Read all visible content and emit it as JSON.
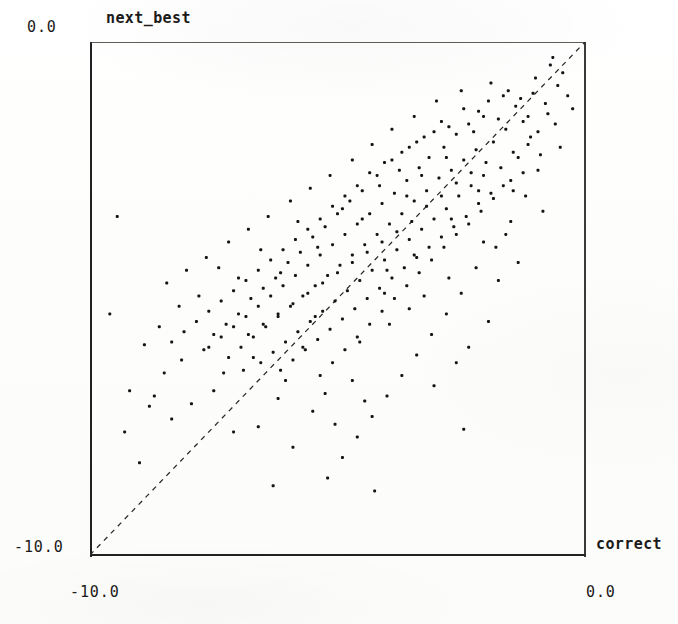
{
  "chart_data": {
    "type": "scatter",
    "title": "",
    "xlabel": "correct",
    "ylabel": "next_best",
    "xlim": [
      -10.0,
      0.0
    ],
    "ylim": [
      -10.0,
      0.0
    ],
    "grid": false,
    "legend": null,
    "xticks": [
      "-10.0",
      "0.0"
    ],
    "yticks": [
      "-10.0",
      "0.0"
    ],
    "annotations": [
      {
        "type": "line",
        "name": "identity-line",
        "style": "dashed",
        "from": [
          -10.0,
          -10.0
        ],
        "to": [
          0.0,
          0.0
        ]
      }
    ],
    "marker": {
      "shape": "square",
      "color": "#151313",
      "size": 3.0
    },
    "n_points": 282,
    "points": [
      [
        -1.05,
        -1.0
      ],
      [
        -0.55,
        -0.85
      ],
      [
        -1.4,
        -1.25
      ],
      [
        -0.75,
        -1.4
      ],
      [
        -1.95,
        -1.15
      ],
      [
        -1.25,
        -1.55
      ],
      [
        -2.05,
        -1.45
      ],
      [
        -0.95,
        -1.75
      ],
      [
        -1.6,
        -1.7
      ],
      [
        -2.35,
        -1.6
      ],
      [
        -1.15,
        -2.0
      ],
      [
        -2.6,
        -1.8
      ],
      [
        -1.85,
        -1.95
      ],
      [
        -3.05,
        -1.75
      ],
      [
        -2.2,
        -2.1
      ],
      [
        -1.35,
        -2.25
      ],
      [
        -2.85,
        -2.05
      ],
      [
        -3.4,
        -1.95
      ],
      [
        -2.45,
        -2.3
      ],
      [
        -1.7,
        -2.45
      ],
      [
        -3.15,
        -2.25
      ],
      [
        -2.05,
        -2.6
      ],
      [
        -3.7,
        -2.15
      ],
      [
        -2.7,
        -2.5
      ],
      [
        -1.5,
        -2.7
      ],
      [
        -3.35,
        -2.45
      ],
      [
        -2.3,
        -2.8
      ],
      [
        -4.05,
        -2.35
      ],
      [
        -2.95,
        -2.65
      ],
      [
        -1.9,
        -2.95
      ],
      [
        -3.6,
        -2.7
      ],
      [
        -2.55,
        -3.0
      ],
      [
        -4.35,
        -2.55
      ],
      [
        -3.2,
        -2.9
      ],
      [
        -2.15,
        -3.15
      ],
      [
        -3.85,
        -2.95
      ],
      [
        -2.8,
        -3.25
      ],
      [
        -4.6,
        -2.8
      ],
      [
        -3.45,
        -3.1
      ],
      [
        -2.4,
        -3.4
      ],
      [
        -4.1,
        -3.15
      ],
      [
        -3.05,
        -3.45
      ],
      [
        -4.85,
        -3.0
      ],
      [
        -3.7,
        -3.35
      ],
      [
        -2.65,
        -3.6
      ],
      [
        -4.35,
        -3.35
      ],
      [
        -3.3,
        -3.65
      ],
      [
        -5.1,
        -3.2
      ],
      [
        -3.95,
        -3.55
      ],
      [
        -2.9,
        -3.8
      ],
      [
        -4.6,
        -3.55
      ],
      [
        -3.55,
        -3.85
      ],
      [
        -5.35,
        -3.45
      ],
      [
        -4.2,
        -3.75
      ],
      [
        -3.15,
        -4.0
      ],
      [
        -4.85,
        -3.75
      ],
      [
        -3.8,
        -4.05
      ],
      [
        -5.6,
        -3.65
      ],
      [
        -4.45,
        -3.95
      ],
      [
        -3.4,
        -4.2
      ],
      [
        -5.1,
        -3.95
      ],
      [
        -4.05,
        -4.25
      ],
      [
        -5.85,
        -3.85
      ],
      [
        -4.7,
        -4.15
      ],
      [
        -3.65,
        -4.4
      ],
      [
        -5.35,
        -4.15
      ],
      [
        -4.3,
        -4.45
      ],
      [
        -6.1,
        -4.05
      ],
      [
        -4.95,
        -4.35
      ],
      [
        -3.9,
        -4.6
      ],
      [
        -5.6,
        -4.35
      ],
      [
        -4.55,
        -4.65
      ],
      [
        -6.35,
        -4.25
      ],
      [
        -5.2,
        -4.55
      ],
      [
        -4.15,
        -4.8
      ],
      [
        -5.85,
        -4.55
      ],
      [
        -4.8,
        -4.85
      ],
      [
        -6.6,
        -4.45
      ],
      [
        -5.45,
        -4.75
      ],
      [
        -4.4,
        -5.0
      ],
      [
        -6.1,
        -4.75
      ],
      [
        -5.05,
        -5.05
      ],
      [
        -6.85,
        -4.65
      ],
      [
        -5.7,
        -4.95
      ],
      [
        -4.65,
        -5.2
      ],
      [
        -6.35,
        -4.95
      ],
      [
        -5.3,
        -5.25
      ],
      [
        -7.1,
        -4.85
      ],
      [
        -5.95,
        -5.15
      ],
      [
        -4.9,
        -5.4
      ],
      [
        -6.6,
        -5.15
      ],
      [
        -5.55,
        -5.45
      ],
      [
        -7.35,
        -5.05
      ],
      [
        -6.2,
        -5.35
      ],
      [
        -5.15,
        -5.6
      ],
      [
        -6.85,
        -5.35
      ],
      [
        -5.8,
        -5.65
      ],
      [
        -7.6,
        -5.25
      ],
      [
        -6.45,
        -5.55
      ],
      [
        -5.4,
        -5.8
      ],
      [
        -7.1,
        -5.55
      ],
      [
        -6.05,
        -5.85
      ],
      [
        -7.85,
        -5.45
      ],
      [
        -6.7,
        -5.75
      ],
      [
        -5.65,
        -6.0
      ],
      [
        -7.35,
        -5.75
      ],
      [
        -6.3,
        -6.05
      ],
      [
        -8.1,
        -5.65
      ],
      [
        -6.95,
        -5.95
      ],
      [
        -5.9,
        -6.2
      ],
      [
        -7.6,
        -5.95
      ],
      [
        -6.55,
        -6.25
      ],
      [
        -8.35,
        -5.85
      ],
      [
        -7.2,
        -6.15
      ],
      [
        -6.15,
        -6.4
      ],
      [
        -0.8,
        -1.2
      ],
      [
        -1.55,
        -0.95
      ],
      [
        -2.15,
        -1.35
      ],
      [
        -0.6,
        -1.6
      ],
      [
        -1.75,
        -1.5
      ],
      [
        -2.45,
        -1.3
      ],
      [
        -1.1,
        -1.85
      ],
      [
        -2.75,
        -1.65
      ],
      [
        -1.45,
        -2.15
      ],
      [
        -3.25,
        -1.85
      ],
      [
        -2.0,
        -2.35
      ],
      [
        -1.25,
        -2.55
      ],
      [
        -3.55,
        -2.05
      ],
      [
        -2.3,
        -2.55
      ],
      [
        -1.65,
        -2.8
      ],
      [
        -3.9,
        -2.3
      ],
      [
        -2.6,
        -2.75
      ],
      [
        -1.85,
        -3.05
      ],
      [
        -4.2,
        -2.6
      ],
      [
        -2.9,
        -3.0
      ],
      [
        -2.1,
        -3.3
      ],
      [
        -4.5,
        -2.9
      ],
      [
        -3.2,
        -3.2
      ],
      [
        -2.35,
        -3.55
      ],
      [
        -4.75,
        -3.1
      ],
      [
        -3.5,
        -3.5
      ],
      [
        -2.6,
        -3.75
      ],
      [
        -5.0,
        -3.35
      ],
      [
        -3.8,
        -3.7
      ],
      [
        -2.85,
        -4.0
      ],
      [
        -5.25,
        -3.6
      ],
      [
        -4.1,
        -3.9
      ],
      [
        -3.1,
        -4.25
      ],
      [
        -5.5,
        -3.8
      ],
      [
        -4.4,
        -4.1
      ],
      [
        -3.35,
        -4.5
      ],
      [
        -5.75,
        -4.1
      ],
      [
        -4.7,
        -4.3
      ],
      [
        -3.6,
        -4.75
      ],
      [
        -6.0,
        -4.3
      ],
      [
        -5.0,
        -4.5
      ],
      [
        -3.85,
        -5.0
      ],
      [
        -6.25,
        -4.6
      ],
      [
        -5.3,
        -4.7
      ],
      [
        -4.1,
        -5.25
      ],
      [
        -6.5,
        -4.8
      ],
      [
        -5.6,
        -4.9
      ],
      [
        -4.35,
        -5.5
      ],
      [
        -6.75,
        -5.0
      ],
      [
        -5.9,
        -5.1
      ],
      [
        -4.6,
        -5.75
      ],
      [
        -7.0,
        -5.3
      ],
      [
        -6.2,
        -5.3
      ],
      [
        -4.85,
        -6.0
      ],
      [
        -7.25,
        -5.5
      ],
      [
        -6.5,
        -5.5
      ],
      [
        -5.1,
        -6.25
      ],
      [
        -7.5,
        -5.7
      ],
      [
        -6.8,
        -5.7
      ],
      [
        -5.35,
        -6.5
      ],
      [
        -0.45,
        -0.6
      ],
      [
        -0.35,
        -1.05
      ],
      [
        -1.9,
        -0.8
      ],
      [
        -0.9,
        -2.2
      ],
      [
        -2.5,
        -0.95
      ],
      [
        -1.2,
        -3.0
      ],
      [
        -3.0,
        -1.15
      ],
      [
        -1.5,
        -3.5
      ],
      [
        -3.45,
        -1.45
      ],
      [
        -1.8,
        -4.0
      ],
      [
        -3.9,
        -1.7
      ],
      [
        -2.2,
        -4.4
      ],
      [
        -4.3,
        -2.0
      ],
      [
        -2.5,
        -4.9
      ],
      [
        -4.7,
        -2.3
      ],
      [
        -2.8,
        -5.3
      ],
      [
        -5.15,
        -2.6
      ],
      [
        -3.1,
        -5.7
      ],
      [
        -5.55,
        -2.85
      ],
      [
        -3.4,
        -6.1
      ],
      [
        -5.95,
        -3.1
      ],
      [
        -3.7,
        -6.5
      ],
      [
        -6.4,
        -3.4
      ],
      [
        -4.0,
        -6.9
      ],
      [
        -6.8,
        -3.65
      ],
      [
        -4.3,
        -7.3
      ],
      [
        -7.2,
        -3.9
      ],
      [
        -4.6,
        -7.7
      ],
      [
        -7.65,
        -4.2
      ],
      [
        -4.9,
        -8.1
      ],
      [
        -8.05,
        -4.45
      ],
      [
        -5.2,
        -8.5
      ],
      [
        -8.45,
        -4.7
      ],
      [
        -0.25,
        -1.3
      ],
      [
        -0.7,
        -0.45
      ],
      [
        -1.0,
        -0.7
      ],
      [
        -1.3,
        -1.1
      ],
      [
        -1.65,
        -1.05
      ],
      [
        -2.25,
        -1.75
      ],
      [
        -2.9,
        -1.55
      ],
      [
        -3.3,
        -2.6
      ],
      [
        -3.6,
        -3.0
      ],
      [
        -4.15,
        -2.8
      ],
      [
        -4.5,
        -3.45
      ],
      [
        -4.9,
        -3.25
      ],
      [
        -5.4,
        -4.0
      ],
      [
        -5.8,
        -3.5
      ],
      [
        -6.15,
        -4.5
      ],
      [
        -6.55,
        -4.05
      ],
      [
        -7.0,
        -4.6
      ],
      [
        -7.4,
        -4.4
      ],
      [
        -7.8,
        -4.95
      ],
      [
        -8.2,
        -5.15
      ],
      [
        -8.6,
        -5.55
      ],
      [
        -6.9,
        -6.4
      ],
      [
        -7.5,
        -6.8
      ],
      [
        -6.2,
        -6.95
      ],
      [
        -5.5,
        -7.2
      ],
      [
        -6.6,
        -7.5
      ],
      [
        -5.9,
        -7.9
      ],
      [
        -7.1,
        -7.6
      ],
      [
        -4.7,
        -6.6
      ],
      [
        -5.05,
        -7.45
      ],
      [
        -4.45,
        -7.0
      ],
      [
        -8.15,
        -6.2
      ],
      [
        -7.7,
        -6.0
      ],
      [
        -8.5,
        -6.45
      ],
      [
        -8.9,
        -5.9
      ],
      [
        -9.2,
        -6.8
      ],
      [
        -3.95,
        -5.5
      ],
      [
        -3.25,
        -4.95
      ],
      [
        -2.75,
        -4.6
      ],
      [
        -2.05,
        -3.9
      ],
      [
        -1.45,
        -2.9
      ],
      [
        -9.45,
        -3.4
      ],
      [
        -6.3,
        -8.65
      ],
      [
        -4.25,
        -8.75
      ],
      [
        -8.8,
        -7.1
      ],
      [
        -9.0,
        -8.2
      ],
      [
        -2.6,
        -6.25
      ],
      [
        -3.05,
        -6.7
      ],
      [
        -2.35,
        -5.95
      ],
      [
        -1.95,
        -5.45
      ],
      [
        -8.35,
        -7.35
      ],
      [
        -7.95,
        -7.05
      ],
      [
        -0.5,
        -2.05
      ],
      [
        -0.95,
        -2.5
      ],
      [
        -1.15,
        -1.45
      ],
      [
        -2.8,
        -2.25
      ],
      [
        -3.75,
        -2.5
      ],
      [
        -4.05,
        -4.9
      ],
      [
        -5.7,
        -5.95
      ],
      [
        -6.05,
        -6.6
      ],
      [
        -4.55,
        -5.85
      ],
      [
        -3.55,
        -5.2
      ],
      [
        -9.3,
        -7.6
      ],
      [
        -5.25,
        -6.85
      ],
      [
        -2.45,
        -7.55
      ],
      [
        -0.65,
        -0.3
      ],
      [
        -1.75,
        -4.65
      ],
      [
        -6.7,
        -6.15
      ],
      [
        -7.3,
        -6.45
      ],
      [
        -8.7,
        -6.9
      ],
      [
        -9.6,
        -5.3
      ],
      [
        -5.45,
        -5.35
      ],
      [
        -4.0,
        -4.45
      ],
      [
        -3.45,
        -4.15
      ],
      [
        -2.7,
        -3.45
      ],
      [
        -1.6,
        -3.75
      ],
      [
        -2.15,
        -2.9
      ],
      [
        -0.85,
        -3.3
      ],
      [
        -1.35,
        -4.3
      ]
    ]
  },
  "labels": {
    "y_tick_top": "0.0",
    "y_tick_bottom": "-10.0",
    "x_tick_left": "-10.0",
    "x_tick_right": "0.0",
    "y_axis_title": "next_best",
    "x_axis_title": "correct"
  }
}
